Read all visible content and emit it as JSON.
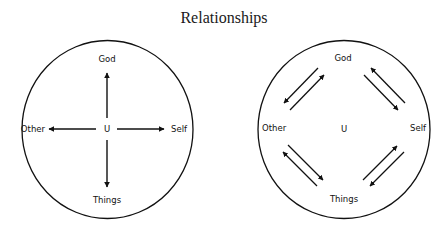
{
  "title": "Relationships",
  "diagrams": [
    {
      "name": "hub",
      "center_label": "U",
      "labels": {
        "top": "God",
        "right": "Self",
        "bottom": "Things",
        "left": "Other"
      },
      "arrows": "from center U outward to each of God, Self, Things, Other"
    },
    {
      "name": "cycle",
      "center_label": "U",
      "labels": {
        "top": "God",
        "right": "Self",
        "bottom": "Things",
        "left": "Other"
      },
      "arrows": "paired bidirectional arrows between adjacent nodes: God-Self, Self-Things, Things-Other, Other-God"
    }
  ],
  "colors": {
    "stroke": "#111111",
    "background": "#ffffff"
  }
}
